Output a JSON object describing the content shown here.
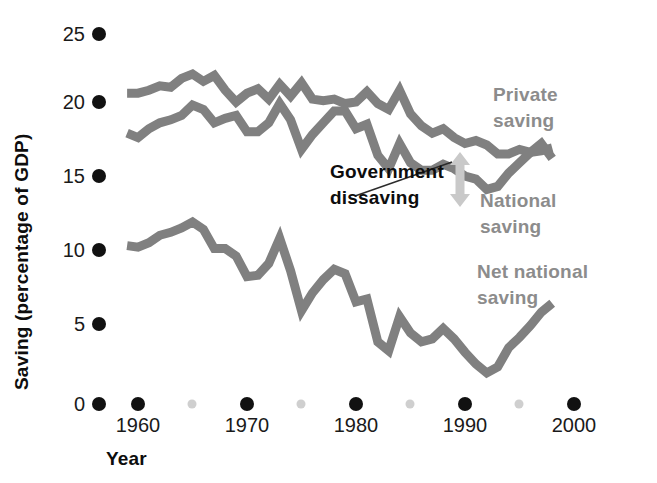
{
  "figure": {
    "background": "#ffffff",
    "line_color": "#808080",
    "label_gray": "#8c8c8c",
    "label_black": "#0d0d0d",
    "tick_major_color": "#111111",
    "tick_minor_color": "#cfcfcf"
  },
  "axes": {
    "y_title": "Saving (percentage of GDP)",
    "x_title": "Year",
    "y_ticks": [
      "0",
      "5",
      "10",
      "15",
      "20",
      "25"
    ],
    "x_ticks": [
      "1960",
      "1970",
      "1980",
      "1990",
      "2000"
    ],
    "x_minor_ticks": [
      "1965",
      "1975",
      "1985",
      "1995"
    ]
  },
  "annotations": {
    "private_saving": "Private\nsaving",
    "private_saving_line1": "Private",
    "private_saving_line2": "saving",
    "national_saving_line1": "National",
    "national_saving_line2": "saving",
    "net_national_saving_line1": "Net national",
    "net_national_saving_line2": "saving",
    "government_dissaving_line1": "Government",
    "government_dissaving_line2": "dissaving"
  },
  "chart_data": {
    "type": "line",
    "title": "",
    "xlabel": "Year",
    "ylabel": "Saving (percentage of GDP)",
    "xlim": [
      1958,
      2000
    ],
    "ylim": [
      0,
      25
    ],
    "grid": false,
    "legend": "inline-annotations",
    "x": [
      1959,
      1960,
      1961,
      1962,
      1963,
      1964,
      1965,
      1966,
      1967,
      1968,
      1969,
      1970,
      1971,
      1972,
      1973,
      1974,
      1975,
      1976,
      1977,
      1978,
      1979,
      1980,
      1981,
      1982,
      1983,
      1984,
      1985,
      1986,
      1987,
      1988,
      1989,
      1990,
      1991,
      1992,
      1993,
      1994,
      1995,
      1996,
      1997,
      1998
    ],
    "series": [
      {
        "name": "Private saving",
        "color": "#808080",
        "values": [
          21.0,
          21.0,
          21.2,
          21.5,
          21.4,
          22.0,
          22.3,
          21.8,
          22.2,
          21.2,
          20.4,
          21.0,
          21.3,
          20.6,
          21.6,
          20.8,
          21.7,
          20.6,
          20.5,
          20.6,
          20.3,
          20.4,
          21.1,
          20.3,
          19.9,
          21.2,
          19.6,
          18.8,
          18.3,
          18.6,
          18.0,
          17.6,
          17.8,
          17.5,
          16.9,
          16.9,
          17.2,
          17.0,
          17.1,
          17.3
        ]
      },
      {
        "name": "National saving",
        "color": "#808080",
        "values": [
          18.3,
          18.0,
          18.6,
          19.0,
          19.2,
          19.5,
          20.2,
          19.9,
          19.0,
          19.3,
          19.5,
          18.4,
          18.4,
          19.0,
          20.3,
          19.2,
          17.2,
          18.2,
          19.0,
          19.8,
          19.8,
          18.6,
          18.9,
          16.8,
          15.9,
          17.6,
          16.3,
          15.8,
          15.8,
          16.2,
          15.9,
          15.4,
          15.2,
          14.5,
          14.7,
          15.6,
          16.3,
          17.0,
          17.6,
          16.6
        ]
      },
      {
        "name": "Net national saving",
        "color": "#808080",
        "values": [
          10.7,
          10.6,
          10.9,
          11.4,
          11.6,
          11.9,
          12.3,
          11.8,
          10.5,
          10.5,
          10.0,
          8.6,
          8.7,
          9.5,
          11.2,
          9.0,
          6.3,
          7.5,
          8.4,
          9.1,
          8.8,
          6.9,
          7.1,
          4.2,
          3.6,
          5.9,
          4.8,
          4.2,
          4.4,
          5.1,
          4.4,
          3.5,
          2.7,
          2.1,
          2.5,
          3.8,
          4.5,
          5.3,
          6.2,
          6.8
        ]
      }
    ],
    "annotations": [
      {
        "text": "Private saving",
        "kind": "series-label"
      },
      {
        "text": "National saving",
        "kind": "series-label"
      },
      {
        "text": "Net national saving",
        "kind": "series-label"
      },
      {
        "text": "Government dissaving",
        "kind": "callout",
        "description": "vertical gap between Private saving and National saving"
      }
    ]
  }
}
